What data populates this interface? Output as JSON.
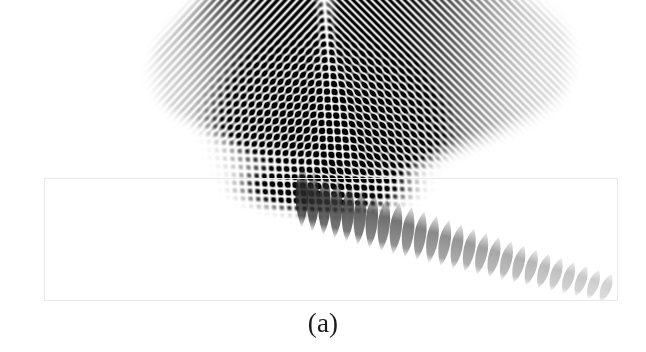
{
  "figure": {
    "kind": "scientific-figure",
    "domain_label": "wave-interference-field",
    "caption": "(a)",
    "caption_font_size_px": 27,
    "caption_x_center_px": 323,
    "caption_y_px": 308,
    "canvas": {
      "width": 646,
      "height": 352,
      "background": "#ffffff"
    }
  },
  "boundary_rect": {
    "label": "simulation-domain-outline",
    "x": 44,
    "y": 178,
    "width": 574,
    "height": 123,
    "stroke": "#e9e9ec",
    "stroke_width": 1,
    "fill": "none"
  },
  "chart_data": {
    "type": "heatmap",
    "title": "(a)",
    "subtitle": "",
    "xlabel": "",
    "ylabel": "",
    "grid": false,
    "legend": "none",
    "colormap": "grayscale-inverted",
    "colormap_stops": [
      "#ffffff",
      "#b8b8b8",
      "#6e6e6e",
      "#2a2a2a",
      "#070707"
    ],
    "value_range": [
      0,
      1
    ],
    "xlim": [
      0,
      646
    ],
    "ylim": [
      0,
      352
    ],
    "field_model": {
      "apex_x": 326,
      "apex_y": 22,
      "left_beam": {
        "name": "left-wing-wavetrain",
        "tip_x": 139,
        "tip_y": 62,
        "stripe_angle_deg": 47,
        "stripe_period_px": 11.6,
        "propagation_dir_deg": -47,
        "peak_amplitude": 1.0
      },
      "right_beam": {
        "name": "right-wing-wavetrain",
        "tip_x": 582,
        "tip_y": 33,
        "stripe_angle_deg": -45,
        "stripe_period_px": 10.4,
        "propagation_dir_deg": 45,
        "peak_amplitude": 1.0
      },
      "core_lattice": {
        "name": "interference-checkerboard",
        "center_x": 326,
        "center_y": 130,
        "cell_width_px": 15.5,
        "cell_height_px": 13.0,
        "rows": 9,
        "cols": 14
      },
      "tail_lobes": {
        "name": "decaying-lobe-train",
        "count": 26,
        "start_x": 300,
        "start_y": 196,
        "end_x": 606,
        "end_y": 288,
        "tilt_start_deg": 6,
        "tilt_end_deg": 22,
        "length_start_px": 62,
        "length_end_px": 30,
        "width_start_px": 10,
        "width_end_px": 8,
        "opacity_start": 0.92,
        "opacity_end": 0.48
      }
    },
    "envelope_vertices": [
      [
        139,
        62
      ],
      [
        326,
        22
      ],
      [
        582,
        33
      ],
      [
        446,
        160
      ],
      [
        326,
        200
      ],
      [
        222,
        168
      ]
    ],
    "intensity_profile_samples": [
      {
        "x": 160,
        "y": 75,
        "value": 0.18
      },
      {
        "x": 210,
        "y": 78,
        "value": 0.52
      },
      {
        "x": 262,
        "y": 80,
        "value": 0.88
      },
      {
        "x": 300,
        "y": 60,
        "value": 0.72
      },
      {
        "x": 326,
        "y": 40,
        "value": 0.3
      },
      {
        "x": 360,
        "y": 48,
        "value": 0.58
      },
      {
        "x": 420,
        "y": 62,
        "value": 0.93
      },
      {
        "x": 470,
        "y": 72,
        "value": 0.86
      },
      {
        "x": 520,
        "y": 58,
        "value": 0.44
      },
      {
        "x": 566,
        "y": 40,
        "value": 0.16
      },
      {
        "x": 326,
        "y": 120,
        "value": 0.64
      },
      {
        "x": 326,
        "y": 160,
        "value": 0.8
      },
      {
        "x": 326,
        "y": 188,
        "value": 0.95
      },
      {
        "x": 380,
        "y": 210,
        "value": 0.6
      },
      {
        "x": 440,
        "y": 230,
        "value": 0.46
      },
      {
        "x": 500,
        "y": 252,
        "value": 0.4
      },
      {
        "x": 560,
        "y": 272,
        "value": 0.34
      },
      {
        "x": 600,
        "y": 284,
        "value": 0.3
      }
    ]
  }
}
